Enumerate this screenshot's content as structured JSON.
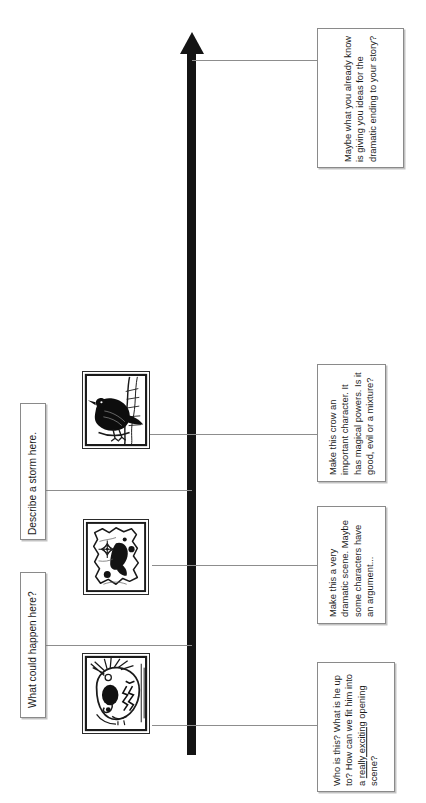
{
  "page": {
    "orientation": "landscape-rotated-text",
    "background_color": "#ffffff",
    "arrow_color": "#141414",
    "connector_color": "#8d8d8d",
    "note_border_color": "#8a8a8a",
    "text_color": "#1b1b1b"
  },
  "timeline": {
    "name": "story-arrow",
    "direction": "upward",
    "description": "thick black vertical arrow pointing up"
  },
  "prompt_notes": [
    {
      "id": "ending-note",
      "text": "Maybe what you already know is giving you ideas for the dramatic ending to your story?",
      "side": "right",
      "order": 4
    },
    {
      "id": "crow-note",
      "text": "Make this crow an important character. It has magical powers. Is it good, evil or a mixture?",
      "side": "right",
      "order": 3
    },
    {
      "id": "dramatic-scene-note",
      "text": "Make this a very dramatic scene. Maybe some characters have an argument...",
      "side": "right",
      "order": 2
    },
    {
      "id": "opening-scene-note",
      "text_before": "Who is this? What is he up to? How can we fit him into a ",
      "text_underlined": "really exciting",
      "text_after": " opening scene?",
      "side": "right",
      "order": 1
    }
  ],
  "left_labels": [
    {
      "id": "storm-label",
      "text": "Describe a storm here.",
      "side": "left",
      "order": 2
    },
    {
      "id": "happen-label",
      "text": "What could happen here?",
      "side": "left",
      "order": 1
    }
  ],
  "illustrations": [
    {
      "id": "crow-illustration",
      "name": "crow-illustration",
      "alt": "black crow perched, woodcut style",
      "order": 3
    },
    {
      "id": "map-illustration",
      "name": "map-illustration",
      "alt": "torn treasure map with compass rose and ink blot",
      "order": 2
    },
    {
      "id": "face-illustration",
      "name": "face-illustration",
      "alt": "stylised face portrait, woodcut style",
      "order": 1
    }
  ]
}
